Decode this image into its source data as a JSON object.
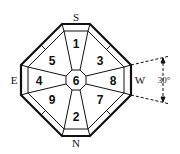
{
  "diagram": {
    "directions": {
      "top": "S",
      "bottom": "N",
      "left": "E",
      "right": "W"
    },
    "cells": {
      "top": "1",
      "bottom": "2",
      "top_right": "3",
      "left": "4",
      "top_left": "5",
      "center": "6",
      "bottom_right": "7",
      "right": "8",
      "bottom_left": "9"
    },
    "angle_label": "30°",
    "colors": {
      "stroke": "#111111",
      "background": "#ffffff"
    }
  }
}
